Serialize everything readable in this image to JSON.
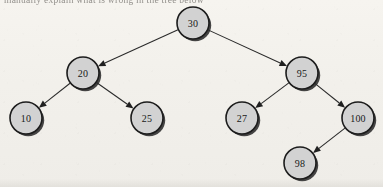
{
  "page": {
    "caption_fragment": "manually explain what is wrong in the tree below",
    "background_color": "#f3f1ec"
  },
  "diagram": {
    "node_fill": "#d2d2d2",
    "node_stroke": "#1c1c1c",
    "edge_color": "#2a2a2a",
    "label_color": "#181818",
    "node_radius": 16,
    "nodes": [
      {
        "id": "n30",
        "label": "30",
        "x": 193,
        "y": 23,
        "level": 1
      },
      {
        "id": "n20",
        "label": "20",
        "x": 83,
        "y": 73,
        "level": 2
      },
      {
        "id": "n95",
        "label": "95",
        "x": 302,
        "y": 73,
        "level": 2
      },
      {
        "id": "n10",
        "label": "10",
        "x": 26,
        "y": 118,
        "level": 3
      },
      {
        "id": "n25",
        "label": "25",
        "x": 147,
        "y": 118,
        "level": 3
      },
      {
        "id": "n27",
        "label": "27",
        "x": 242,
        "y": 118,
        "level": 3
      },
      {
        "id": "n100",
        "label": "100",
        "x": 358,
        "y": 118,
        "level": 3
      },
      {
        "id": "n98",
        "label": "98",
        "x": 300,
        "y": 163,
        "level": 4
      }
    ],
    "edges": [
      {
        "from": "n30",
        "to": "n20",
        "side": "left"
      },
      {
        "from": "n30",
        "to": "n95",
        "side": "right"
      },
      {
        "from": "n20",
        "to": "n10",
        "side": "left"
      },
      {
        "from": "n20",
        "to": "n25",
        "side": "right"
      },
      {
        "from": "n95",
        "to": "n27",
        "side": "left"
      },
      {
        "from": "n95",
        "to": "n100",
        "side": "right"
      },
      {
        "from": "n100",
        "to": "n98",
        "side": "left"
      }
    ]
  }
}
